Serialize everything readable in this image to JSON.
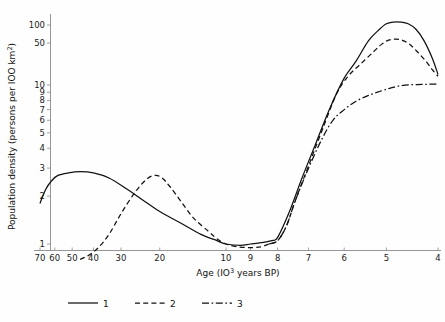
{
  "chart_data": {
    "type": "line",
    "title": "",
    "xlabel": "Age  (10³ years  BP)",
    "xlabel_pre": "Age  (IO",
    "xlabel_sup": "3",
    "xlabel_post": " years  BP)",
    "ylabel": "Population density (persons per IOO km²)",
    "ylabel_pre": "Population density (persons per IOO km",
    "ylabel_sup": "2",
    "ylabel_post": ")",
    "xscale": "log-reversed",
    "yscale": "log",
    "xlim": [
      70,
      4
    ],
    "ylim": [
      0.8,
      130
    ],
    "grid": false,
    "legend_position": "bottom-center",
    "xticks": [
      70,
      60,
      50,
      40,
      30,
      20,
      10,
      9,
      8,
      7,
      6,
      5,
      4
    ],
    "xtick_labels": [
      "70",
      "60",
      "50",
      "40",
      "30",
      "20",
      "10",
      "9",
      "8",
      "7",
      "6",
      "5",
      "4"
    ],
    "yticks": [
      1,
      2,
      3,
      4,
      5,
      6,
      7,
      8,
      9,
      10,
      50,
      100
    ],
    "ytick_labels": [
      "1",
      "2",
      "3",
      "4",
      "5",
      "6",
      "7",
      "8",
      "9",
      "10",
      "50",
      "100"
    ],
    "legend": [
      {
        "key": "1",
        "label": "1",
        "style": "solid"
      },
      {
        "key": "2",
        "label": "2",
        "style": "dashed"
      },
      {
        "key": "3",
        "label": "3",
        "style": "dash-dot"
      }
    ],
    "series": [
      {
        "name": "1",
        "label": "1",
        "style": "solid",
        "points": [
          [
            70,
            1.8
          ],
          [
            66,
            2.2
          ],
          [
            62,
            2.5
          ],
          [
            58,
            2.7
          ],
          [
            52,
            2.8
          ],
          [
            46,
            2.85
          ],
          [
            40,
            2.8
          ],
          [
            34,
            2.6
          ],
          [
            28,
            2.2
          ],
          [
            24,
            1.9
          ],
          [
            20,
            1.6
          ],
          [
            16,
            1.35
          ],
          [
            13,
            1.15
          ],
          [
            11,
            1.05
          ],
          [
            10,
            1.0
          ],
          [
            9.4,
            0.98
          ],
          [
            9,
            1.0
          ],
          [
            8.6,
            1.02
          ],
          [
            8.2,
            1.05
          ],
          [
            8,
            1.1
          ],
          [
            7.6,
            1.6
          ],
          [
            7.2,
            2.6
          ],
          [
            6.8,
            4.2
          ],
          [
            6.4,
            7.0
          ],
          [
            6.0,
            13
          ],
          [
            5.7,
            25
          ],
          [
            5.4,
            55
          ],
          [
            5.15,
            85
          ],
          [
            5.0,
            105
          ],
          [
            4.85,
            112
          ],
          [
            4.7,
            112
          ],
          [
            4.55,
            105
          ],
          [
            4.4,
            85
          ],
          [
            4.25,
            55
          ],
          [
            4.1,
            28
          ],
          [
            4.0,
            15
          ]
        ]
      },
      {
        "name": "2",
        "label": "2",
        "style": "dashed",
        "points": [
          [
            46,
            0.8
          ],
          [
            42,
            0.85
          ],
          [
            38,
            0.95
          ],
          [
            34,
            1.15
          ],
          [
            30,
            1.55
          ],
          [
            26,
            2.1
          ],
          [
            23,
            2.55
          ],
          [
            21,
            2.7
          ],
          [
            19.5,
            2.6
          ],
          [
            18,
            2.3
          ],
          [
            16,
            1.85
          ],
          [
            14,
            1.45
          ],
          [
            12,
            1.2
          ],
          [
            11,
            1.08
          ],
          [
            10,
            1.0
          ],
          [
            9.5,
            0.96
          ],
          [
            9,
            0.95
          ],
          [
            8.6,
            0.96
          ],
          [
            8.3,
            1.0
          ],
          [
            8,
            1.05
          ],
          [
            7.7,
            1.3
          ],
          [
            7.4,
            1.9
          ],
          [
            7.0,
            3.1
          ],
          [
            6.6,
            5.2
          ],
          [
            6.2,
            8.8
          ],
          [
            5.9,
            14
          ],
          [
            5.6,
            22
          ],
          [
            5.3,
            35
          ],
          [
            5.1,
            48
          ],
          [
            4.95,
            56
          ],
          [
            4.8,
            58
          ],
          [
            4.65,
            55
          ],
          [
            4.5,
            46
          ],
          [
            4.35,
            34
          ],
          [
            4.2,
            24
          ],
          [
            4.1,
            18
          ],
          [
            4.0,
            14
          ]
        ]
      },
      {
        "name": "3",
        "label": "3",
        "style": "dash-dot",
        "points": [
          [
            8.3,
            1.0
          ],
          [
            8,
            1.05
          ],
          [
            7.7,
            1.3
          ],
          [
            7.4,
            1.9
          ],
          [
            7.0,
            3.0
          ],
          [
            6.6,
            4.6
          ],
          [
            6.3,
            6.0
          ],
          [
            6.0,
            7.0
          ],
          [
            5.7,
            7.9
          ],
          [
            5.4,
            8.6
          ],
          [
            5.1,
            9.2
          ],
          [
            4.9,
            9.6
          ],
          [
            4.7,
            9.9
          ],
          [
            4.5,
            10.1
          ],
          [
            4.3,
            10.2
          ],
          [
            4.15,
            10.3
          ],
          [
            4.0,
            10.3
          ]
        ]
      }
    ]
  }
}
